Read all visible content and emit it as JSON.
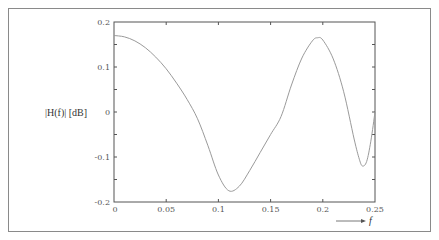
{
  "chart_data": {
    "type": "line",
    "title": "",
    "xlabel": "f",
    "ylabel": "|H(f)| [dB]",
    "xlim": [
      0,
      0.25
    ],
    "ylim": [
      -0.2,
      0.2
    ],
    "grid": false,
    "legend": null,
    "x_ticks": [
      "0",
      "0.05",
      "0.1",
      "0.15",
      "0.2",
      "0.25"
    ],
    "y_ticks": [
      "0.2",
      "0.1",
      "0",
      "-0.1",
      "-0.2"
    ],
    "series": [
      {
        "name": "|H(f)|",
        "color": "#9a9a9a",
        "x": [
          0,
          0.01,
          0.02,
          0.03,
          0.04,
          0.05,
          0.06,
          0.07,
          0.08,
          0.09,
          0.1,
          0.11,
          0.12,
          0.13,
          0.14,
          0.15,
          0.16,
          0.17,
          0.18,
          0.19,
          0.195,
          0.2,
          0.21,
          0.22,
          0.23,
          0.235,
          0.238,
          0.242,
          0.246,
          0.25
        ],
        "values": [
          0.17,
          0.167,
          0.158,
          0.143,
          0.122,
          0.096,
          0.064,
          0.028,
          -0.015,
          -0.075,
          -0.14,
          -0.175,
          -0.165,
          -0.13,
          -0.09,
          -0.05,
          -0.01,
          0.06,
          0.12,
          0.158,
          0.165,
          0.16,
          0.118,
          0.045,
          -0.06,
          -0.105,
          -0.12,
          -0.11,
          -0.065,
          0.0
        ]
      }
    ],
    "annotations": [
      "arrow pointing right toward f label below x-axis"
    ]
  },
  "labels": {
    "ylabel": "|H(f)| [dB]",
    "xlabel": "f",
    "x_ticks": [
      "0",
      "0.05",
      "0.1",
      "0.15",
      "0.2",
      "0.25"
    ],
    "y_ticks": [
      "0.2",
      "0.1",
      "0",
      "-0.1",
      "-0.2"
    ]
  }
}
